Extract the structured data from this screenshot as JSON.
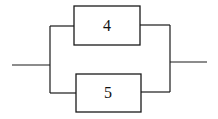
{
  "diagram": {
    "type": "parallel-system",
    "components": [
      {
        "id": "top",
        "label": "4"
      },
      {
        "id": "bottom",
        "label": "5"
      }
    ],
    "connections": "components 4 and 5 connected in parallel between an input line and an output line"
  }
}
